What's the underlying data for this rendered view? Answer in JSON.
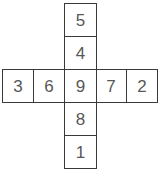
{
  "figure": {
    "type": "cross-number-grid",
    "title": "",
    "background_color": "#ffffff",
    "border_color": "#3a3a3a",
    "text_color": "#575757"
  },
  "grid": {
    "shape": "plus",
    "rows": 5,
    "columns": 5,
    "center_value": "9",
    "vertical_arm": {
      "label": "vertical",
      "values": [
        "5",
        "4",
        "9",
        "8",
        "1"
      ]
    },
    "horizontal_arm": {
      "label": "horizontal",
      "values": [
        "3",
        "6",
        "9",
        "7",
        "2"
      ]
    },
    "cells": [
      {
        "id": "top-1",
        "value": "5",
        "row": 0,
        "col": 2
      },
      {
        "id": "top-2",
        "value": "4",
        "row": 1,
        "col": 2
      },
      {
        "id": "left-1",
        "value": "3",
        "row": 2,
        "col": 0
      },
      {
        "id": "left-2",
        "value": "6",
        "row": 2,
        "col": 1
      },
      {
        "id": "center",
        "value": "9",
        "row": 2,
        "col": 2
      },
      {
        "id": "right-1",
        "value": "7",
        "row": 2,
        "col": 3
      },
      {
        "id": "right-2",
        "value": "2",
        "row": 2,
        "col": 4
      },
      {
        "id": "bottom-1",
        "value": "8",
        "row": 3,
        "col": 2
      },
      {
        "id": "bottom-2",
        "value": "1",
        "row": 4,
        "col": 2
      }
    ]
  }
}
